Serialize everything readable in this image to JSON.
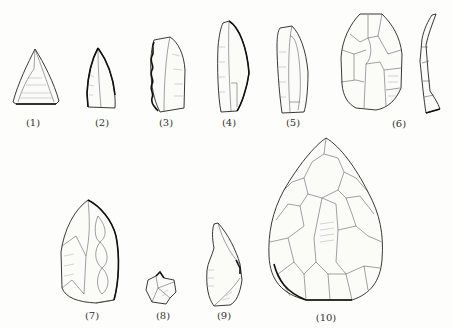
{
  "figure": {
    "line_color": "#222222",
    "background": "#fdfdfb",
    "artifacts": [
      {
        "id": 1,
        "label": "(1)",
        "shape": "triangular point"
      },
      {
        "id": 2,
        "label": "(2)",
        "shape": "retouched pointed flake"
      },
      {
        "id": 3,
        "label": "(3)",
        "shape": "notched/denticulate flake"
      },
      {
        "id": 4,
        "label": "(4)",
        "shape": "backed blade"
      },
      {
        "id": 5,
        "label": "(5)",
        "shape": "blade"
      },
      {
        "id": 6,
        "label": "(6)",
        "shape": "flake core face and side profile"
      },
      {
        "id": 7,
        "label": "(7)",
        "shape": "retouched point"
      },
      {
        "id": 8,
        "label": "(8)",
        "shape": "small borer"
      },
      {
        "id": 9,
        "label": "(9)",
        "shape": "flake with retouched edge"
      },
      {
        "id": 10,
        "label": "(10)",
        "shape": "bifacial handaxe"
      }
    ]
  }
}
